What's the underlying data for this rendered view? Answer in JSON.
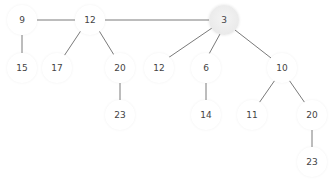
{
  "diagram": {
    "type": "tree",
    "colors": {
      "edge": "#7a7a7a",
      "node_fill": "#ffffff",
      "highlight_fill": "#e9e9e9",
      "text": "#444444"
    },
    "nodes": [
      {
        "id": "n9",
        "label": "9",
        "x": 22,
        "y": 20
      },
      {
        "id": "n12a",
        "label": "12",
        "x": 90,
        "y": 20
      },
      {
        "id": "n3",
        "label": "3",
        "x": 224,
        "y": 20,
        "highlight": true
      },
      {
        "id": "n15",
        "label": "15",
        "x": 22,
        "y": 68
      },
      {
        "id": "n17",
        "label": "17",
        "x": 57,
        "y": 68
      },
      {
        "id": "n20a",
        "label": "20",
        "x": 120,
        "y": 68
      },
      {
        "id": "n12b",
        "label": "12",
        "x": 159,
        "y": 68
      },
      {
        "id": "n6",
        "label": "6",
        "x": 206,
        "y": 68
      },
      {
        "id": "n10",
        "label": "10",
        "x": 282,
        "y": 68
      },
      {
        "id": "n23a",
        "label": "23",
        "x": 120,
        "y": 115
      },
      {
        "id": "n14",
        "label": "14",
        "x": 206,
        "y": 115
      },
      {
        "id": "n11",
        "label": "11",
        "x": 252,
        "y": 115
      },
      {
        "id": "n20b",
        "label": "20",
        "x": 312,
        "y": 115
      },
      {
        "id": "n23b",
        "label": "23",
        "x": 312,
        "y": 162
      }
    ],
    "edges": [
      [
        "n9",
        "n12a"
      ],
      [
        "n12a",
        "n3"
      ],
      [
        "n9",
        "n15"
      ],
      [
        "n12a",
        "n17"
      ],
      [
        "n12a",
        "n20a"
      ],
      [
        "n20a",
        "n23a"
      ],
      [
        "n3",
        "n12b"
      ],
      [
        "n3",
        "n6"
      ],
      [
        "n3",
        "n10"
      ],
      [
        "n6",
        "n14"
      ],
      [
        "n10",
        "n11"
      ],
      [
        "n10",
        "n20b"
      ],
      [
        "n20b",
        "n23b"
      ]
    ]
  }
}
